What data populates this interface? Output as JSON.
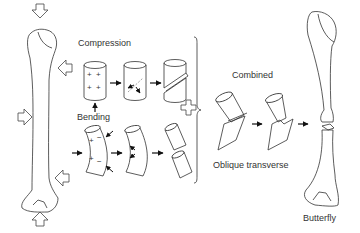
{
  "labels": {
    "compression": "Compression",
    "bending": "Bending",
    "combined": "Combined",
    "oblique_transverse": "Oblique transverse",
    "butterfly": "Butterfly"
  },
  "signs": {
    "plus": "+",
    "minus": "−"
  },
  "icons": {
    "load_arrow": "hollow-arrow-icon",
    "flow_arrow": "black-arrow-icon",
    "combine": "plus-sign-icon",
    "bracket": "bracket"
  },
  "colors": {
    "line": "#333333",
    "text": "#333333",
    "background": "#ffffff"
  }
}
